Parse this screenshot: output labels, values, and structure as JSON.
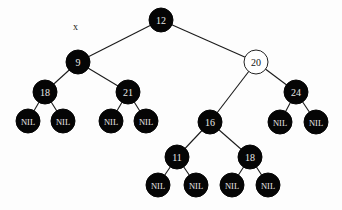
{
  "diagram": {
    "type": "red-black-tree",
    "annotation": {
      "text": "x",
      "x": 73,
      "y": 30
    },
    "colors": {
      "black_node": "#050505",
      "red_node_shown_as_white": "#ffffff",
      "edge": "#1a1a1a"
    },
    "nodes": [
      {
        "id": "n12",
        "label": "12",
        "color": "black",
        "x": 161,
        "y": 20,
        "r": 12
      },
      {
        "id": "n9",
        "label": "9",
        "color": "black",
        "x": 78,
        "y": 62,
        "r": 12
      },
      {
        "id": "n20",
        "label": "20",
        "color": "white",
        "x": 256,
        "y": 62,
        "r": 12
      },
      {
        "id": "n18a",
        "label": "18",
        "color": "black",
        "x": 45,
        "y": 92,
        "r": 12
      },
      {
        "id": "n21",
        "label": "21",
        "color": "black",
        "x": 128,
        "y": 92,
        "r": 12
      },
      {
        "id": "n16",
        "label": "16",
        "color": "black",
        "x": 210,
        "y": 122,
        "r": 12
      },
      {
        "id": "n24",
        "label": "24",
        "color": "black",
        "x": 296,
        "y": 92,
        "r": 12
      },
      {
        "id": "n11",
        "label": "11",
        "color": "black",
        "x": 177,
        "y": 157,
        "r": 12
      },
      {
        "id": "n18b",
        "label": "18",
        "color": "black",
        "x": 250,
        "y": 157,
        "r": 12
      },
      {
        "id": "nil1",
        "label": "NIL",
        "color": "black",
        "x": 28,
        "y": 121,
        "r": 12,
        "nil": true
      },
      {
        "id": "nil2",
        "label": "NIL",
        "color": "black",
        "x": 63,
        "y": 121,
        "r": 12,
        "nil": true
      },
      {
        "id": "nil3",
        "label": "NIL",
        "color": "black",
        "x": 111,
        "y": 121,
        "r": 12,
        "nil": true
      },
      {
        "id": "nil4",
        "label": "NIL",
        "color": "black",
        "x": 146,
        "y": 121,
        "r": 12,
        "nil": true
      },
      {
        "id": "nil5",
        "label": "NIL",
        "color": "black",
        "x": 280,
        "y": 122,
        "r": 12,
        "nil": true
      },
      {
        "id": "nil6",
        "label": "NIL",
        "color": "black",
        "x": 316,
        "y": 122,
        "r": 12,
        "nil": true
      },
      {
        "id": "nil7",
        "label": "NIL",
        "color": "black",
        "x": 158,
        "y": 185,
        "r": 12,
        "nil": true
      },
      {
        "id": "nil8",
        "label": "NIL",
        "color": "black",
        "x": 196,
        "y": 185,
        "r": 12,
        "nil": true
      },
      {
        "id": "nil9",
        "label": "NIL",
        "color": "black",
        "x": 232,
        "y": 185,
        "r": 12,
        "nil": true
      },
      {
        "id": "nil10",
        "label": "NIL",
        "color": "black",
        "x": 268,
        "y": 185,
        "r": 12,
        "nil": true
      }
    ],
    "edges": [
      [
        "n12",
        "n9"
      ],
      [
        "n12",
        "n20"
      ],
      [
        "n9",
        "n18a"
      ],
      [
        "n9",
        "n21"
      ],
      [
        "n20",
        "n16"
      ],
      [
        "n20",
        "n24"
      ],
      [
        "n18a",
        "nil1"
      ],
      [
        "n18a",
        "nil2"
      ],
      [
        "n21",
        "nil3"
      ],
      [
        "n21",
        "nil4"
      ],
      [
        "n24",
        "nil5"
      ],
      [
        "n24",
        "nil6"
      ],
      [
        "n16",
        "n11"
      ],
      [
        "n16",
        "n18b"
      ],
      [
        "n11",
        "nil7"
      ],
      [
        "n11",
        "nil8"
      ],
      [
        "n18b",
        "nil9"
      ],
      [
        "n18b",
        "nil10"
      ]
    ]
  }
}
